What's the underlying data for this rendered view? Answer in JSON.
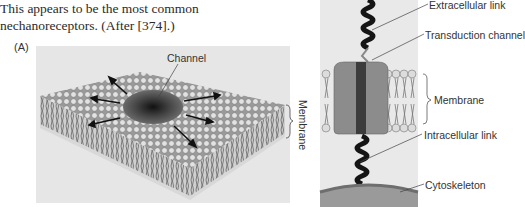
{
  "caption": {
    "line1": "This appears to be the most common",
    "line2": "nechanoreceptors. (After [374].)"
  },
  "panel_a": {
    "label": "(A)",
    "channel_label": "Channel",
    "membrane_label": "Membrane"
  },
  "panel_b": {
    "labels": {
      "extracellular": "Extracellular link",
      "transduction": "Transduction channel",
      "membrane": "Membrane",
      "intracellular": "Intracellular link",
      "cytoskeleton": "Cytoskeleton"
    }
  },
  "colors": {
    "panel_bg": "#e6e6e6",
    "lipid_head": "#d8d8d8",
    "lipid_outline": "#888888",
    "channel_dark": "#3a3a3a",
    "channel_body": "#8a8a8a",
    "spring": "#1a1a1a",
    "cytoskeleton": "#7a7a7a"
  }
}
